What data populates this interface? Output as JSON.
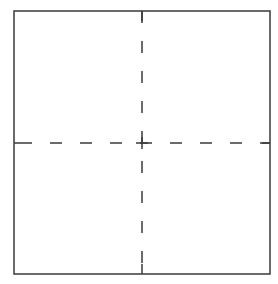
{
  "diagram": {
    "type": "square-with-dashed-center-lines",
    "canvas": {
      "width": 278,
      "height": 284
    },
    "square": {
      "x1": 14,
      "y1": 11,
      "x2": 270,
      "y2": 274
    },
    "center": {
      "x": 142,
      "y": 143
    },
    "colors": {
      "background": "#ffffff",
      "border": "#3a3a3a",
      "dash": "#3a3a3a"
    },
    "stroke": {
      "border_width": 1.5,
      "dash_width": 1.5
    },
    "dash_pattern": {
      "dash": 12,
      "gap": 18
    },
    "quadrants": [
      "top-left",
      "top-right",
      "bottom-left",
      "bottom-right"
    ]
  }
}
